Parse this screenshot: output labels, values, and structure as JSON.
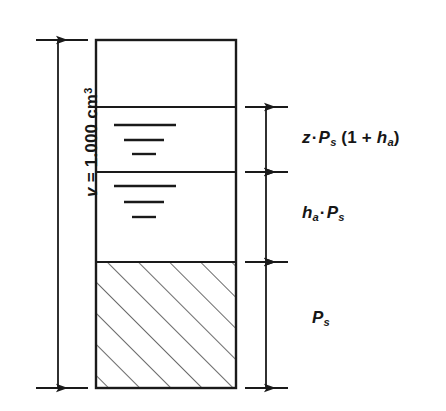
{
  "diagram": {
    "type": "engineering-dimension-diagram",
    "canvas": {
      "width": 446,
      "height": 411
    },
    "colors": {
      "background": "#ffffff",
      "stroke": "#1a1a1a",
      "fill": "#ffffff",
      "hatch": "#1a1a1a",
      "text": "#161616"
    }
  },
  "container": {
    "name": "volume-column",
    "x": 96,
    "y": 40,
    "width": 140,
    "height": 348,
    "stroke_width": 2.2
  },
  "overall_dimension": {
    "label_prefix": "v",
    "label_equals": " = ",
    "label_value": "1.000",
    "label_unit": "cm",
    "label_unit_exponent": "3",
    "label_full": "v = 1.000 cm³",
    "from_y": 40,
    "to_y": 388,
    "arrow_x": 58,
    "ext_line_x1": 36,
    "ext_line_x2": 88
  },
  "sections": [
    {
      "name": "headspace-section",
      "top": 40,
      "bottom": 107,
      "fill": "empty",
      "ticks": 0,
      "dimension": null
    },
    {
      "name": "vapor-section",
      "top": 107,
      "bottom": 172,
      "fill": "level-ticks",
      "ticks": 3,
      "tick_lengths": [
        62,
        40,
        24
      ],
      "dimension": {
        "label": "z · Ps (1 + ha)",
        "label_parts": {
          "var1": "z",
          "dot1": "·",
          "var2": "P",
          "sub2": "s",
          "open": " (1 + ",
          "var3": "h",
          "sub3": "a",
          "close": ")"
        },
        "label_y": 145
      }
    },
    {
      "name": "liquid-section",
      "top": 172,
      "bottom": 262,
      "fill": "level-ticks",
      "ticks": 3,
      "tick_lengths": [
        62,
        40,
        24
      ],
      "dimension": {
        "label": "ha · Ps",
        "label_parts": {
          "var1": "h",
          "sub1": "a",
          "dot1": "·",
          "var2": "P",
          "sub2": "s"
        },
        "label_y": 215
      }
    },
    {
      "name": "solid-section",
      "top": 262,
      "bottom": 388,
      "fill": "diagonal-hatch",
      "ticks": 0,
      "dimension": {
        "label": "Ps",
        "label_parts": {
          "var1": "P",
          "sub1": "s"
        },
        "label_y": 320
      }
    }
  ],
  "right_dimension_chain": {
    "arrow_x": 266,
    "ext_line_x1": 245,
    "ext_line_x2": 288,
    "extension_y_values": [
      107,
      172,
      262,
      388
    ]
  },
  "hatch": {
    "angle_deg": 45,
    "spacing_px": 22,
    "stroke_width": 1.3,
    "direction": "bottom-left-to-top-right"
  },
  "level_ticks": {
    "stroke_width": 2.4,
    "vapor_rows_y": [
      125,
      140,
      154
    ],
    "liquid_rows_y": [
      186,
      202,
      217
    ],
    "start_x": 114
  }
}
